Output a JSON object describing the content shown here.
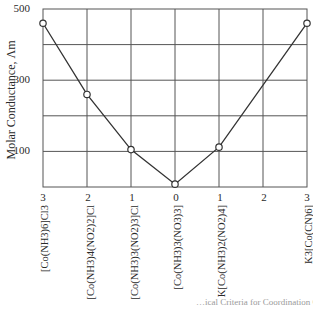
{
  "chart_data": {
    "type": "line",
    "title": "",
    "xlabel": "",
    "ylabel": "Molar Conductance, Λm",
    "ylim": [
      0,
      500
    ],
    "yticks": [
      100,
      300,
      500
    ],
    "grid": true,
    "x_tick_labels": [
      "3",
      "2",
      "1",
      "0",
      "1",
      "2",
      "3"
    ],
    "categories": [
      "[Co(NH3)6]Cl3",
      "[Co(NH3)4(NO2)2]Cl",
      "[Co(NH3)3(NO2)3]Cl",
      "[Co(NH3)3(NO3)3]",
      "K[Co(NH3)2(NO2)4]",
      "",
      "K3[Co(CN)6]"
    ],
    "series": [
      {
        "name": "Molar Conductance",
        "points": [
          {
            "x_index": 0,
            "label": "[Co(NH3)6]Cl3",
            "ions": 3,
            "value": 460
          },
          {
            "x_index": 1,
            "label": "[Co(NH3)4(NO2)2]Cl",
            "ions": 2,
            "value": 260
          },
          {
            "x_index": 2,
            "label": "[Co(NH3)3(NO2)3]Cl",
            "ions": 1,
            "value": 105
          },
          {
            "x_index": 3,
            "label": "[Co(NH3)3(NO3)3]",
            "ions": 0,
            "value": 8
          },
          {
            "x_index": 4,
            "label": "K[Co(NH3)2(NO2)4]",
            "ions": 1,
            "value": 112
          },
          {
            "x_index": 6,
            "label": "K3[Co(CN)6]",
            "ions": 3,
            "value": 460
          }
        ]
      }
    ]
  },
  "labels": {
    "ylabel": "Molar Conductance, Λm",
    "yticks": [
      "500",
      "300",
      "100"
    ],
    "xticks": [
      "3",
      "2",
      "1",
      "0",
      "1",
      "2",
      "3"
    ],
    "xcats": [
      "[Co(NH3)6]Cl3",
      "[Co(NH3)4(NO2)2]Cl",
      "[Co(NH3)3(NO2)3]Cl",
      "[Co(NH3)3(NO3)3]",
      "K[Co(NH3)2(NO2)4]",
      "K3[Co(CN)6]"
    ],
    "caption": "…ical Criteria for Coordination Comp…"
  }
}
